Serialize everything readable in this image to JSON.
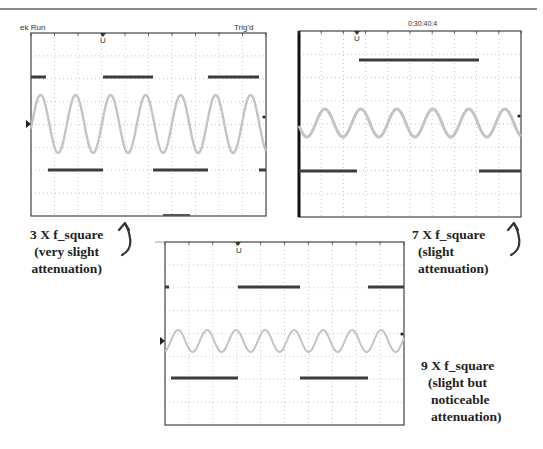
{
  "page": {
    "header_fragment": "...ng ... p...",
    "colors": {
      "square_wave": "#3c3c3c",
      "sine_wave": "#c4c4c4",
      "grid": "#b8b8b8",
      "frame": "#444444",
      "caption_text": "#222222"
    }
  },
  "scopes": [
    {
      "id": "scope-3x",
      "status_left": "ek Run",
      "status_right": "Trig'd",
      "trigger_marker": "U",
      "channel_marker": "D",
      "harmonic": 3
    },
    {
      "id": "scope-7x",
      "status_center": "0:30:40:4",
      "trigger_marker": "U",
      "harmonic": 7
    },
    {
      "id": "scope-9x",
      "trigger_marker": "U",
      "channel_marker": ">",
      "harmonic": 9
    }
  ],
  "captions": [
    {
      "line1": "3 X f_square",
      "line2": "(very slight",
      "line3": "attenuation)"
    },
    {
      "line1": "7 X f_square",
      "line2": "(slight",
      "line3": "attenuation)"
    },
    {
      "line1": "9 X f_square",
      "line2": "(slight but",
      "line3": "noticeable",
      "line4": "attenuation)"
    }
  ],
  "arrows": [
    {
      "icon": "curved-up-arrow-icon",
      "glyph": "↶"
    },
    {
      "icon": "curved-up-arrow-icon",
      "glyph": "↶"
    }
  ]
}
